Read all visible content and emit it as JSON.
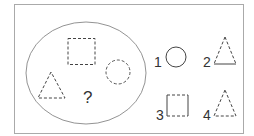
{
  "puzzle": {
    "question_mark": "?",
    "stroke_color": "#444444",
    "frame_color": "#aaaaaa",
    "set_shapes": [
      {
        "shape": "square",
        "style": "all-dashed"
      },
      {
        "shape": "circle",
        "style": "all-dashed"
      },
      {
        "shape": "triangle",
        "style": "all-dashed"
      }
    ],
    "options": [
      {
        "label": "1",
        "shape": "circle",
        "style": "solid"
      },
      {
        "label": "2",
        "shape": "triangle",
        "style": "dashed-sides-solid-base"
      },
      {
        "label": "3",
        "shape": "square",
        "style": "solid-sides-dashed-top-bottom"
      },
      {
        "label": "4",
        "shape": "triangle",
        "style": "all-dashed"
      }
    ]
  }
}
